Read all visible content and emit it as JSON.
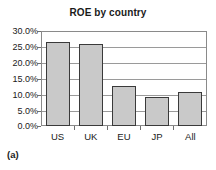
{
  "chart_data": {
    "type": "bar",
    "title": "ROE by country",
    "xlabel": "",
    "ylabel": "",
    "categories": [
      "US",
      "UK",
      "EU",
      "JP",
      "All"
    ],
    "values": [
      26.5,
      26.0,
      12.5,
      9.3,
      10.7
    ],
    "value_unit": "%",
    "ylim": [
      0.0,
      30.0
    ],
    "ytick_values": [
      30.0,
      25.0,
      20.0,
      15.0,
      10.0,
      5.0,
      0.0
    ],
    "ytick_labels": [
      "30.0%",
      "25.0%",
      "20.0%",
      "15.0%",
      "10.0%",
      "5.0%",
      "0.0%"
    ],
    "grid": true,
    "legend": null,
    "legend_position": "none",
    "bar_fill_color": "#c9c9c9",
    "bar_edge_color": "#3a3a3a",
    "gridline_color": "#9a9a9a",
    "axis_color": "#8a8a8a",
    "text_color": "#1a1a1a",
    "series": [
      {
        "name": "ROE",
        "values": [
          26.5,
          26.0,
          12.5,
          9.3,
          10.7
        ]
      }
    ]
  },
  "figure": {
    "caption": "(a)"
  }
}
